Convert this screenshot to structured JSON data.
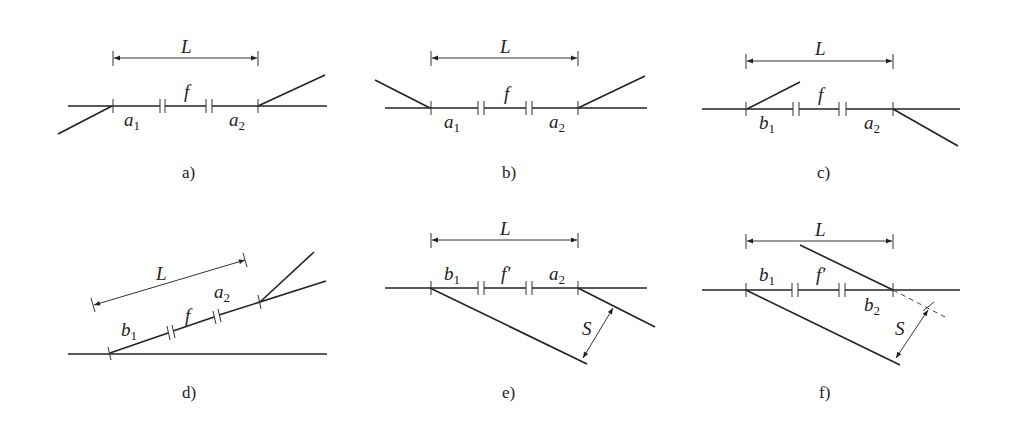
{
  "figure": {
    "panels": [
      {
        "id": "a",
        "caption": "a)",
        "dimension_label": "L",
        "segments": [
          {
            "label": "a",
            "sub": "1"
          },
          {
            "label": "f",
            "sub": ""
          },
          {
            "label": "a",
            "sub": "2"
          }
        ]
      },
      {
        "id": "b",
        "caption": "b)",
        "dimension_label": "L",
        "segments": [
          {
            "label": "a",
            "sub": "1"
          },
          {
            "label": "f",
            "sub": ""
          },
          {
            "label": "a",
            "sub": "2"
          }
        ]
      },
      {
        "id": "c",
        "caption": "c)",
        "dimension_label": "L",
        "segments": [
          {
            "label": "b",
            "sub": "1"
          },
          {
            "label": "f",
            "sub": ""
          },
          {
            "label": "a",
            "sub": "2"
          }
        ]
      },
      {
        "id": "d",
        "caption": "d)",
        "dimension_label": "L",
        "segments": [
          {
            "label": "b",
            "sub": "1"
          },
          {
            "label": "f",
            "sub": ""
          },
          {
            "label": "a",
            "sub": "2"
          }
        ]
      },
      {
        "id": "e",
        "caption": "e)",
        "dimension_label": "L",
        "spacing_label": "S",
        "segments": [
          {
            "label": "b",
            "sub": "1"
          },
          {
            "label": "f′",
            "sub": ""
          },
          {
            "label": "a",
            "sub": "2"
          }
        ]
      },
      {
        "id": "f",
        "caption": "f)",
        "dimension_label": "L",
        "spacing_label": "S",
        "segments": [
          {
            "label": "b",
            "sub": "1"
          },
          {
            "label": "f′",
            "sub": ""
          },
          {
            "label": "b",
            "sub": "2"
          }
        ]
      }
    ]
  },
  "colors": {
    "line": "#222222",
    "background": "#ffffff"
  }
}
